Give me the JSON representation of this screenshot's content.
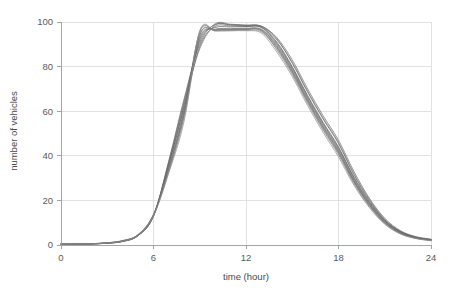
{
  "chart_data": {
    "type": "line",
    "title": "",
    "subtitle": "",
    "xlabel": "time (hour)",
    "ylabel": "number of vehicles",
    "xlim": [
      0,
      24
    ],
    "ylim": [
      0,
      100
    ],
    "xticks": [
      0,
      6,
      12,
      18,
      24
    ],
    "yticks": [
      0,
      20,
      40,
      60,
      80,
      100
    ],
    "xticklabels": [
      "0",
      "6",
      "12",
      "18",
      "24"
    ],
    "yticklabels": [
      "0",
      "20",
      "40",
      "60",
      "80",
      "100"
    ],
    "grid": true,
    "grid_axis": "both",
    "legend": false,
    "legend_position": "none",
    "annotations": [],
    "x": [
      0,
      1,
      2,
      3,
      4,
      5,
      6,
      7,
      8,
      9,
      10,
      11,
      12,
      13,
      14,
      15,
      16,
      17,
      18,
      19,
      20,
      21,
      22,
      23,
      24
    ],
    "series": [
      {
        "name": "day 1",
        "color": "#6e6e6e",
        "values": [
          0.4,
          0.4,
          0.5,
          0.8,
          1.6,
          4.2,
          13.0,
          38.0,
          66.0,
          90.0,
          99.2,
          99.0,
          98.6,
          98.2,
          93.0,
          83.0,
          70.0,
          58.0,
          47.0,
          33.0,
          21.0,
          12.0,
          6.5,
          3.8,
          2.6
        ]
      },
      {
        "name": "day 2",
        "color": "#777777",
        "values": [
          0.4,
          0.4,
          0.5,
          0.8,
          1.6,
          4.2,
          13.0,
          37.0,
          64.0,
          88.0,
          98.6,
          98.6,
          98.4,
          98.0,
          92.0,
          82.0,
          69.0,
          57.0,
          46.0,
          32.0,
          20.5,
          11.5,
          6.2,
          3.6,
          2.5
        ]
      },
      {
        "name": "day 3",
        "color": "#5f5f5f",
        "values": [
          0.4,
          0.4,
          0.5,
          0.8,
          1.6,
          4.2,
          13.0,
          36.0,
          63.0,
          92.0,
          97.5,
          97.8,
          97.9,
          97.6,
          91.0,
          80.0,
          67.0,
          55.0,
          44.0,
          30.5,
          19.5,
          11.0,
          6.0,
          3.5,
          2.4
        ]
      },
      {
        "name": "day 4",
        "color": "#828282",
        "values": [
          0.3,
          0.3,
          0.5,
          0.8,
          1.7,
          4.4,
          13.2,
          35.0,
          61.0,
          94.5,
          96.5,
          96.8,
          97.0,
          96.8,
          90.0,
          79.0,
          66.0,
          54.0,
          43.0,
          29.5,
          18.8,
          10.6,
          5.7,
          3.3,
          2.3
        ]
      },
      {
        "name": "day 5",
        "color": "#6a6a6a",
        "values": [
          0.3,
          0.3,
          0.5,
          0.9,
          1.7,
          4.4,
          13.2,
          34.0,
          60.0,
          95.5,
          96.2,
          96.4,
          96.6,
          96.4,
          89.0,
          78.0,
          65.0,
          53.0,
          42.0,
          28.8,
          18.2,
          10.2,
          5.5,
          3.2,
          2.2
        ]
      },
      {
        "name": "day 6",
        "color": "#8a8a8a",
        "values": [
          0.3,
          0.4,
          0.5,
          0.9,
          1.8,
          4.5,
          13.4,
          33.0,
          58.5,
          95.8,
          96.0,
          96.2,
          96.3,
          95.5,
          88.0,
          77.0,
          64.0,
          52.0,
          41.0,
          28.0,
          17.6,
          9.9,
          5.3,
          3.1,
          2.1
        ]
      },
      {
        "name": "day 7",
        "color": "#636363",
        "values": [
          0.3,
          0.4,
          0.6,
          0.9,
          1.8,
          4.5,
          13.4,
          36.5,
          62.0,
          89.0,
          98.0,
          98.2,
          98.0,
          97.5,
          90.5,
          79.5,
          66.5,
          54.5,
          43.5,
          30.0,
          19.0,
          10.8,
          5.8,
          3.4,
          2.3
        ]
      },
      {
        "name": "day 8",
        "color": "#797979",
        "values": [
          0.3,
          0.4,
          0.6,
          1.0,
          1.9,
          4.6,
          13.6,
          35.5,
          60.5,
          93.0,
          96.8,
          97.0,
          97.2,
          96.5,
          89.5,
          78.5,
          65.5,
          53.5,
          42.5,
          29.0,
          18.5,
          10.4,
          5.6,
          3.3,
          2.2
        ]
      },
      {
        "name": "day 9",
        "color": "#6f6f6f",
        "values": [
          0.3,
          0.4,
          0.6,
          1.0,
          1.9,
          4.6,
          13.6,
          34.5,
          59.0,
          94.0,
          96.4,
          96.6,
          96.8,
          96.0,
          88.5,
          77.5,
          64.5,
          52.5,
          41.5,
          28.4,
          17.9,
          10.0,
          5.4,
          3.1,
          2.1
        ]
      },
      {
        "name": "day 10",
        "color": "#858585",
        "values": [
          0.3,
          0.4,
          0.6,
          1.0,
          2.0,
          4.7,
          13.8,
          33.5,
          57.5,
          92.5,
          96.6,
          96.8,
          97.0,
          96.2,
          87.5,
          76.5,
          63.5,
          51.5,
          40.5,
          27.5,
          17.2,
          9.6,
          5.1,
          3.0,
          2.0
        ]
      },
      {
        "name": "day 11",
        "color": "#676767",
        "values": [
          0.4,
          0.4,
          0.5,
          0.9,
          1.7,
          4.3,
          13.1,
          37.5,
          65.0,
          91.0,
          98.8,
          98.8,
          98.5,
          98.0,
          92.5,
          81.5,
          68.5,
          56.5,
          45.5,
          31.5,
          20.0,
          11.3,
          6.1,
          3.5,
          2.4
        ]
      },
      {
        "name": "day 12",
        "color": "#8e8e8e",
        "values": [
          0.4,
          0.4,
          0.5,
          0.9,
          1.7,
          4.3,
          13.1,
          32.5,
          56.0,
          96.0,
          96.0,
          96.0,
          96.1,
          95.0,
          86.5,
          75.5,
          62.5,
          50.5,
          39.5,
          26.8,
          16.8,
          9.3,
          5.0,
          2.9,
          1.9
        ]
      }
    ]
  },
  "layout": {
    "plot_left": 61,
    "plot_right": 431,
    "plot_top": 22,
    "plot_bottom": 245
  }
}
